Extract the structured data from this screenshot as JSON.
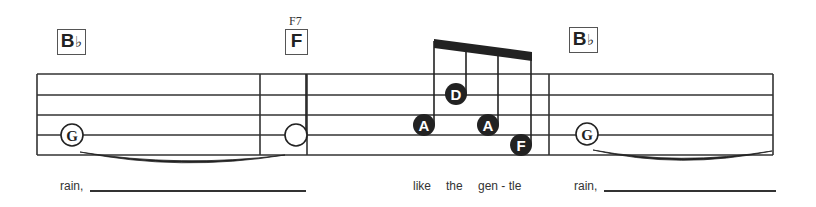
{
  "colors": {
    "ink": "#222222",
    "staff": "#333333",
    "paper": "#ffffff"
  },
  "chords": [
    {
      "root": "B",
      "accidental": "♭",
      "measure": 1
    },
    {
      "root": "F",
      "accidental": "",
      "label": "F7",
      "measure": 2
    },
    {
      "root": "B",
      "accidental": "♭",
      "measure": 4
    }
  ],
  "notes": [
    {
      "name": "G",
      "style": "open-labeled",
      "duration": "whole",
      "measure": 1,
      "tied_to_next": true
    },
    {
      "name": "",
      "style": "open",
      "duration": "half",
      "measure": 2,
      "stem": "up"
    },
    {
      "name": "A",
      "style": "filled-labeled",
      "duration": "eighth",
      "measure": 3,
      "beamed": true
    },
    {
      "name": "D",
      "style": "filled-labeled",
      "duration": "eighth",
      "measure": 3,
      "beamed": true
    },
    {
      "name": "A",
      "style": "filled-labeled",
      "duration": "eighth",
      "measure": 3,
      "beamed": true
    },
    {
      "name": "F",
      "style": "filled-labeled",
      "duration": "eighth",
      "measure": 3,
      "beamed": true
    },
    {
      "name": "G",
      "style": "open-labeled",
      "duration": "whole",
      "measure": 4,
      "tied_to_next": true
    }
  ],
  "lyrics": {
    "l1": "rain,",
    "l2": "like",
    "l3": "the",
    "l4": "gen - tle",
    "l5": "rain,"
  }
}
